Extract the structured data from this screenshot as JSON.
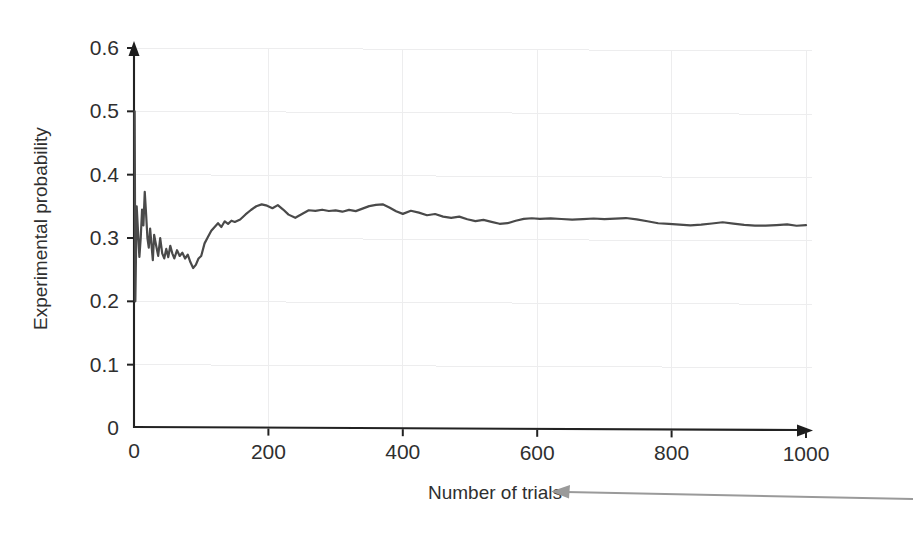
{
  "chart_data": {
    "type": "line",
    "title": "",
    "xlabel": "Number of trials",
    "ylabel": "Experimental probability",
    "xlim": [
      0,
      1000
    ],
    "ylim": [
      0,
      0.6
    ],
    "grid": true,
    "legend": null,
    "x_ticks": [
      "0",
      "200",
      "400",
      "600",
      "800",
      "1000"
    ],
    "x_tick_values": [
      0,
      200,
      400,
      600,
      800,
      1000
    ],
    "y_ticks": [
      "0",
      "0.1",
      "0.2",
      "0.3",
      "0.4",
      "0.5",
      "0.6"
    ],
    "y_tick_values": [
      0,
      0.1,
      0.2,
      0.3,
      0.4,
      0.5,
      0.6
    ],
    "series": [
      {
        "name": "Experimental probability",
        "color": "#4a4a4a",
        "x": [
          1,
          2,
          4,
          6,
          8,
          10,
          12,
          14,
          16,
          18,
          20,
          22,
          24,
          26,
          28,
          30,
          33,
          36,
          39,
          42,
          45,
          48,
          51,
          54,
          57,
          60,
          64,
          68,
          72,
          76,
          80,
          84,
          88,
          92,
          96,
          100,
          105,
          110,
          115,
          120,
          125,
          130,
          135,
          140,
          145,
          150,
          158,
          166,
          174,
          182,
          190,
          198,
          206,
          214,
          222,
          230,
          240,
          250,
          260,
          270,
          280,
          290,
          300,
          310,
          320,
          330,
          340,
          350,
          360,
          370,
          380,
          390,
          400,
          412,
          424,
          436,
          448,
          460,
          472,
          484,
          496,
          508,
          520,
          532,
          544,
          556,
          568,
          580,
          592,
          604,
          620,
          636,
          652,
          668,
          684,
          700,
          716,
          732,
          748,
          764,
          780,
          796,
          812,
          828,
          844,
          860,
          876,
          892,
          908,
          924,
          940,
          956,
          972,
          986,
          1000
        ],
        "y": [
          0.5,
          0.2,
          0.35,
          0.31,
          0.27,
          0.3,
          0.345,
          0.32,
          0.373,
          0.338,
          0.3,
          0.285,
          0.315,
          0.29,
          0.265,
          0.305,
          0.288,
          0.272,
          0.3,
          0.276,
          0.268,
          0.283,
          0.27,
          0.288,
          0.276,
          0.268,
          0.281,
          0.272,
          0.277,
          0.268,
          0.274,
          0.262,
          0.253,
          0.258,
          0.268,
          0.272,
          0.292,
          0.302,
          0.312,
          0.318,
          0.324,
          0.318,
          0.327,
          0.323,
          0.328,
          0.326,
          0.33,
          0.338,
          0.345,
          0.351,
          0.354,
          0.352,
          0.348,
          0.353,
          0.346,
          0.338,
          0.333,
          0.339,
          0.345,
          0.344,
          0.346,
          0.344,
          0.345,
          0.343,
          0.346,
          0.344,
          0.348,
          0.352,
          0.354,
          0.355,
          0.35,
          0.344,
          0.34,
          0.345,
          0.342,
          0.338,
          0.34,
          0.336,
          0.334,
          0.336,
          0.332,
          0.329,
          0.331,
          0.328,
          0.325,
          0.326,
          0.33,
          0.333,
          0.334,
          0.333,
          0.334,
          0.333,
          0.332,
          0.333,
          0.334,
          0.333,
          0.334,
          0.335,
          0.333,
          0.33,
          0.327,
          0.326,
          0.325,
          0.324,
          0.325,
          0.327,
          0.329,
          0.327,
          0.325,
          0.324,
          0.324,
          0.325,
          0.326,
          0.324,
          0.325
        ]
      }
    ],
    "annotations": [
      {
        "name": "callout-arrow",
        "kind": "arrow",
        "points_to": "Number of trials",
        "direction": "left",
        "color": "#9a9a9a"
      }
    ]
  },
  "axis": {
    "x_label": "Number of trials",
    "y_label": "Experimental probability",
    "x_ticks": [
      "0",
      "200",
      "400",
      "600",
      "800",
      "1000"
    ],
    "y_ticks": [
      "0",
      "0.1",
      "0.2",
      "0.3",
      "0.4",
      "0.5",
      "0.6"
    ]
  },
  "colors": {
    "series": "#4a4a4a",
    "axis": "#222222",
    "grid": "#ededee",
    "callout": "#9a9a9a",
    "background": "#ffffff"
  }
}
